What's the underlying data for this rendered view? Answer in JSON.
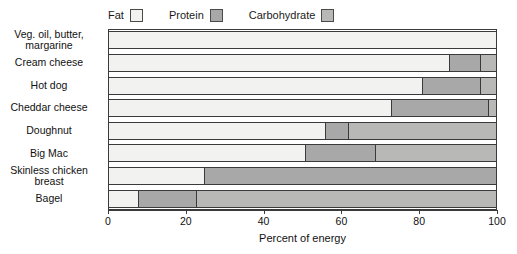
{
  "chart_data": {
    "type": "bar",
    "orientation": "horizontal",
    "stacked": true,
    "stacked_mode": "percent",
    "title": "",
    "subtitle": "",
    "xlabel": "Percent of energy",
    "ylabel": "",
    "xlim": [
      0,
      100
    ],
    "xticks": [
      0,
      20,
      40,
      60,
      80,
      100
    ],
    "xtick_labels": [
      "0",
      "20",
      "40",
      "60",
      "80",
      "100"
    ],
    "grid": false,
    "legend_position": "top-left",
    "categories": [
      "Veg. oil, butter, margarine",
      "Cream cheese",
      "Hot dog",
      "Cheddar cheese",
      "Doughnut",
      "Big Mac",
      "Skinless chicken breast",
      "Bagel"
    ],
    "series": [
      {
        "name": "Fat",
        "color": "#f2f2f0",
        "values": [
          100,
          88,
          81,
          73,
          56,
          51,
          25,
          8
        ]
      },
      {
        "name": "Protein",
        "color": "#a8a8a8",
        "values": [
          0,
          8,
          15,
          25,
          6,
          18,
          75,
          15
        ]
      },
      {
        "name": "Carbohydrate",
        "color": "#b8b8b6",
        "values": [
          0,
          4,
          4,
          2,
          38,
          31,
          0,
          77
        ]
      }
    ]
  },
  "legend": {
    "entries": [
      {
        "label": "Fat",
        "swatch_name": "legend-swatch-fat"
      },
      {
        "label": "Protein",
        "swatch_name": "legend-swatch-protein"
      },
      {
        "label": "Carbohydrate",
        "swatch_name": "legend-swatch-carbohydrate"
      }
    ]
  },
  "colors": {
    "fat": "#f2f2f0",
    "protein": "#a8a8a8",
    "carbohydrate": "#b8b8b6",
    "outline": "#3a3a3a",
    "background": "#ffffff"
  }
}
